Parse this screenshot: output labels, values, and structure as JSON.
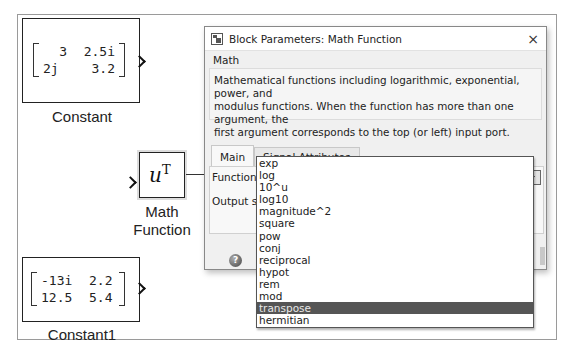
{
  "canvas": {
    "blocks": {
      "constant": {
        "label": "Constant",
        "matrix": [
          [
            "3",
            "2.5i"
          ],
          [
            "2j",
            "3.2"
          ]
        ]
      },
      "math_function": {
        "label_line1": "Math",
        "label_line2": "Function",
        "symbol": "u",
        "superscript": "T"
      },
      "constant1": {
        "label": "Constant1",
        "matrix": [
          [
            "-13i",
            "2.2"
          ],
          [
            "12.5",
            "5.4"
          ]
        ]
      }
    }
  },
  "dialog": {
    "title": "Block Parameters: Math Function",
    "close_label": "×",
    "section": "Math",
    "description_lines": [
      "Mathematical functions including logarithmic, exponential, power, and",
      "modulus functions.  When the function has more than one argument, the",
      "first argument corresponds to the top (or left) input port."
    ],
    "tabs": [
      {
        "label": "Main",
        "active": true
      },
      {
        "label": "Signal Attributes",
        "active": false
      }
    ],
    "function_label": "Function:",
    "function_value": "transpose",
    "output_label": "Output sig",
    "help_label": "?",
    "dropdown_options": [
      "exp",
      "log",
      "10^u",
      "log10",
      "magnitude^2",
      "square",
      "pow",
      "conj",
      "reciprocal",
      "hypot",
      "rem",
      "mod",
      "transpose",
      "hermitian"
    ],
    "selected_option": "transpose"
  }
}
